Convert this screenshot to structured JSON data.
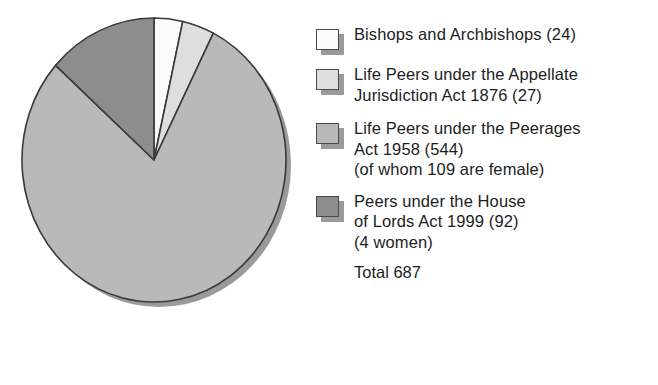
{
  "chart_data": {
    "type": "pie",
    "title": "",
    "categories": [
      "Bishops and Archbishops",
      "Life Peers under the Appellate Jurisdiction Act 1876",
      "Life Peers under the Peerages Act 1958",
      "Peers under the House of Lords Act 1999"
    ],
    "values": [
      24,
      27,
      544,
      92
    ],
    "total": 687,
    "start_angle_deg": 0,
    "direction": "clockwise",
    "legend_position": "right",
    "grid": false,
    "colors": [
      "#fbfbfb",
      "#dedede",
      "#b9b9b9",
      "#8d8d8d"
    ],
    "outline_color": "#3a3a3a",
    "shadow_color": "#9a9a9a",
    "annotations": [
      "of whom 109 are female",
      "4 women",
      "Total 687"
    ]
  },
  "legend": {
    "items": [
      {
        "swatch_color": "#fbfbfb",
        "swatch_name": "legend-swatch-bishops",
        "lines": [
          "Bishops and Archbishops (24)"
        ]
      },
      {
        "swatch_color": "#dedede",
        "swatch_name": "legend-swatch-appellate",
        "lines": [
          "Life Peers under the Appellate",
          "Jurisdiction Act 1876 (27)"
        ]
      },
      {
        "swatch_color": "#b9b9b9",
        "swatch_name": "legend-swatch-peerages",
        "lines": [
          "Life Peers under the Peerages",
          "Act 1958 (544)",
          "(of whom 109 are female)"
        ]
      },
      {
        "swatch_color": "#8d8d8d",
        "swatch_name": "legend-swatch-hol1999",
        "lines": [
          "Peers under the House",
          "of Lords Act 1999 (92)",
          "(4 women)"
        ]
      }
    ],
    "total_label": "Total 687"
  }
}
